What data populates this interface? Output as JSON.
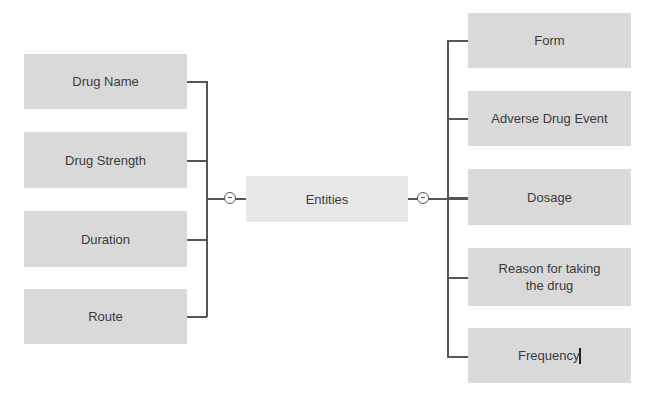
{
  "diagram": {
    "root": {
      "label": "Entities"
    },
    "left_children": [
      {
        "label": "Drug Name"
      },
      {
        "label": "Drug Strength"
      },
      {
        "label": "Duration"
      },
      {
        "label": "Route"
      }
    ],
    "right_children": [
      {
        "label": "Form"
      },
      {
        "label": "Adverse Drug Event"
      },
      {
        "label": "Dosage"
      },
      {
        "label": "Reason for taking the drug"
      },
      {
        "label": "Frequency"
      }
    ],
    "collapse_icons": {
      "left": "collapse-minus-icon",
      "right": "collapse-minus-icon"
    },
    "colors": {
      "node_fill": "#d9d9d9",
      "root_fill": "#e8e8e8",
      "connector": "#555555",
      "text": "#3c3c3c"
    }
  }
}
